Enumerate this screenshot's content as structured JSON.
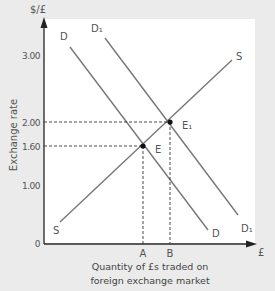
{
  "chart_data": {
    "type": "line",
    "title": "",
    "xlabel": "Quantity of £s traded on foreign exchange market",
    "xlabel_lines": [
      "Quantity of £s traded on",
      "foreign exchange market"
    ],
    "ylabel": "Exchange rate",
    "y_unit": "$/£",
    "x_unit": "£",
    "y_ticks": [
      {
        "value": 0,
        "label": "0"
      },
      {
        "value": 1.0,
        "label": "1.00"
      },
      {
        "value": 1.6,
        "label": "1.60"
      },
      {
        "value": 2.0,
        "label": "2.00"
      },
      {
        "value": 3.0,
        "label": "3.00"
      }
    ],
    "x_ticks": [
      {
        "key": "A",
        "label": "A"
      },
      {
        "key": "B",
        "label": "B"
      }
    ],
    "series": [
      {
        "name": "S",
        "label_start": "S",
        "label_end": "S",
        "kind": "supply",
        "direction": "upward"
      },
      {
        "name": "D",
        "label_start": "D",
        "label_end": "D",
        "kind": "demand",
        "direction": "downward"
      },
      {
        "name": "D1",
        "label_start": "D₁",
        "label_end": "D₁",
        "kind": "demand",
        "direction": "downward"
      }
    ],
    "points": [
      {
        "name": "E",
        "label": "E",
        "x": "A",
        "y": 1.6
      },
      {
        "name": "E1",
        "label": "E₁",
        "x": "B",
        "y": 2.0
      }
    ],
    "grid": false,
    "legend": "none"
  }
}
